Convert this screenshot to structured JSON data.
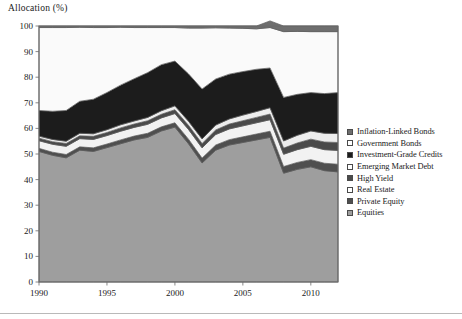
{
  "axis_title": "Allocation (%)",
  "colors": {
    "equities": "#9e9e9e",
    "private_equity": "#4f4f4f",
    "real_estate": "#f2f2f2",
    "high_yield": "#4a4a4a",
    "emerging_market_debt": "#ededed",
    "investment_grade_credits": "#1c1c1c",
    "government_bonds": "#fafafa",
    "inflation_linked_bonds": "#6e6e6e",
    "frame": "#6b6b6b",
    "stroke": "#5a5a5a",
    "text": "#1a1a1a"
  },
  "legend": {
    "items": [
      {
        "label": "Inflation-Linked Bonds",
        "swatch": "filled",
        "color": "#6e6e6e",
        "key": "inflation_linked_bonds"
      },
      {
        "label": "Government Bonds",
        "swatch": "open",
        "color": "#fafafa",
        "key": "government_bonds"
      },
      {
        "label": "Investment-Grade Credits",
        "swatch": "filled",
        "color": "#1c1c1c",
        "key": "investment_grade_credits"
      },
      {
        "label": "Emerging Market Debt",
        "swatch": "open",
        "color": "#ededed",
        "key": "emerging_market_debt"
      },
      {
        "label": "High Yield",
        "swatch": "filled",
        "color": "#4a4a4a",
        "key": "high_yield"
      },
      {
        "label": "Real Estate",
        "swatch": "open",
        "color": "#f2f2f2",
        "key": "real_estate"
      },
      {
        "label": "Private Equity",
        "swatch": "filled",
        "color": "#4f4f4f",
        "key": "private_equity"
      },
      {
        "label": "Equities",
        "swatch": "filled",
        "color": "#9e9e9e",
        "key": "equities"
      }
    ]
  },
  "chart_data": {
    "type": "area",
    "stacked": true,
    "title": "",
    "xlabel": "",
    "ylabel": "Allocation (%)",
    "xlim": [
      1990,
      2012
    ],
    "ylim": [
      0,
      100
    ],
    "grid": false,
    "legend_position": "right",
    "xticks": [
      1990,
      1995,
      2000,
      2005,
      2010
    ],
    "yticks": [
      0,
      10,
      20,
      30,
      40,
      50,
      60,
      70,
      80,
      90,
      100
    ],
    "x": [
      1990,
      1991,
      1992,
      1993,
      1994,
      1995,
      1996,
      1997,
      1998,
      1999,
      2000,
      2001,
      2002,
      2003,
      2004,
      2005,
      2006,
      2007,
      2008,
      2009,
      2010,
      2011,
      2012
    ],
    "series": [
      {
        "name": "Equities",
        "key": "equities",
        "values": [
          51.0,
          49.5,
          48.5,
          51.5,
          51.0,
          52.5,
          54.0,
          55.5,
          56.5,
          59.0,
          60.5,
          54.0,
          46.5,
          51.5,
          53.5,
          54.5,
          55.5,
          56.5,
          42.5,
          44.0,
          45.0,
          43.5,
          43.0
        ]
      },
      {
        "name": "Private Equity",
        "key": "private_equity",
        "values": [
          1.2,
          1.2,
          1.3,
          1.3,
          1.4,
          1.4,
          1.5,
          1.5,
          1.6,
          1.6,
          1.7,
          1.8,
          1.9,
          2.0,
          2.1,
          2.2,
          2.3,
          2.4,
          2.6,
          2.7,
          2.8,
          2.9,
          3.0
        ]
      },
      {
        "name": "Real Estate",
        "key": "real_estate",
        "values": [
          3.0,
          3.1,
          3.2,
          3.2,
          3.3,
          3.3,
          3.4,
          3.4,
          3.5,
          3.5,
          3.6,
          3.8,
          4.0,
          4.1,
          4.2,
          4.3,
          4.4,
          4.5,
          4.8,
          5.0,
          5.2,
          5.3,
          5.4
        ]
      },
      {
        "name": "High Yield",
        "key": "high_yield",
        "values": [
          1.0,
          1.0,
          1.1,
          1.1,
          1.2,
          1.2,
          1.3,
          1.3,
          1.4,
          1.4,
          1.5,
          1.6,
          1.7,
          1.8,
          1.9,
          2.0,
          2.1,
          2.2,
          2.4,
          2.6,
          2.8,
          3.0,
          3.1
        ]
      },
      {
        "name": "Emerging Market Debt",
        "key": "emerging_market_debt",
        "values": [
          0.8,
          0.9,
          0.9,
          1.0,
          1.0,
          1.1,
          1.2,
          1.2,
          1.3,
          1.4,
          1.5,
          1.6,
          1.8,
          1.9,
          2.0,
          2.2,
          2.3,
          2.5,
          2.8,
          3.0,
          3.2,
          3.4,
          3.5
        ]
      },
      {
        "name": "Investment-Grade Credits",
        "key": "investment_grade_credits",
        "values": [
          10.0,
          11.0,
          12.0,
          12.5,
          13.5,
          14.5,
          15.5,
          16.5,
          17.5,
          18.0,
          17.5,
          18.5,
          19.5,
          18.0,
          17.5,
          17.0,
          16.5,
          15.5,
          17.0,
          16.0,
          15.0,
          15.5,
          16.0
        ]
      },
      {
        "name": "Government Bonds",
        "key": "government_bonds",
        "values": [
          32.4,
          32.7,
          32.4,
          28.9,
          28.0,
          25.4,
          22.6,
          20.0,
          17.6,
          14.5,
          13.1,
          17.9,
          23.8,
          20.0,
          18.0,
          16.9,
          15.8,
          15.8,
          25.7,
          24.6,
          23.8,
          24.2,
          23.8
        ]
      },
      {
        "name": "Inflation-Linked Bonds",
        "key": "inflation_linked_bonds",
        "values": [
          0.6,
          0.6,
          0.6,
          0.5,
          0.6,
          0.6,
          0.5,
          0.6,
          0.6,
          0.6,
          0.6,
          0.8,
          0.8,
          0.7,
          0.8,
          0.9,
          1.1,
          2.6,
          2.2,
          2.1,
          2.2,
          2.2,
          2.2
        ]
      }
    ]
  }
}
